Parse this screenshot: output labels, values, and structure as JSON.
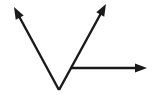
{
  "figure": {
    "type": "geometry-diagram",
    "width": 154,
    "height": 95,
    "background_color": "#ffffff",
    "stroke_color": "#1a1a1a",
    "stroke_width": 2.4
  },
  "geometry": {
    "vertex": {
      "name": "vertex",
      "x": 59,
      "y": 90
    },
    "rays": [
      {
        "name": "ray-upper-left",
        "from": {
          "x": 59,
          "y": 90
        },
        "to": {
          "x": 14,
          "y": 7
        },
        "arrow": "end",
        "direction_deg": 118.5
      },
      {
        "name": "ray-upper-right",
        "from": {
          "x": 59,
          "y": 90
        },
        "to": {
          "x": 106,
          "y": 4
        },
        "arrow": "end",
        "direction_deg": 61.3
      },
      {
        "name": "ray-horizontal-right",
        "from": {
          "x": 70,
          "y": 68
        },
        "to": {
          "x": 147,
          "y": 68
        },
        "arrow": "end",
        "direction_deg": 0
      }
    ],
    "arrowhead": {
      "length": 12,
      "width": 9,
      "style": "solid-triangle"
    }
  },
  "labels": {
    "vertex_label": "",
    "ray_labels": [
      "",
      "",
      ""
    ],
    "angle_labels": []
  }
}
